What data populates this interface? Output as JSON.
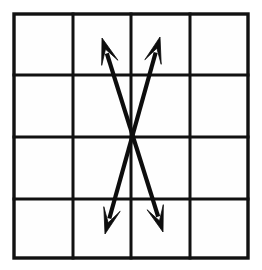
{
  "figure": {
    "canvas": {
      "width": 262,
      "height": 270,
      "background": "#ffffff"
    },
    "colors": {
      "ink": "#111111",
      "arrow": "#0d0d0d",
      "cell_fill": "#fefefe",
      "background": "#ffffff"
    }
  },
  "grid": {
    "name": "square-grid",
    "columns": 4,
    "rows": 4,
    "bounds": {
      "left": 14,
      "top": 14,
      "right": 248,
      "bottom": 258
    },
    "vertical_line_x": [
      14,
      73,
      131,
      190,
      248
    ],
    "horizontal_line_y": [
      14,
      75,
      137,
      199,
      258
    ],
    "line_width": 3,
    "border_width": 3.4
  },
  "arrows": [
    {
      "name": "arrow-up-left-down-right",
      "double_headed": true,
      "start": {
        "x": 102,
        "y": 38
      },
      "end": {
        "x": 163,
        "y": 232
      },
      "head_at_start": true,
      "head_at_end": true,
      "shaft_width": 4.2,
      "head_length": 26,
      "head_half_width": 8.5
    },
    {
      "name": "arrow-up-right-down-left",
      "double_headed": true,
      "start": {
        "x": 160,
        "y": 37
      },
      "end": {
        "x": 105,
        "y": 234
      },
      "head_at_start": true,
      "head_at_end": true,
      "shaft_width": 4.2,
      "head_length": 26,
      "head_half_width": 8.5
    }
  ],
  "intersection": {
    "name": "arrow-crossing-point",
    "x": 133,
    "y": 138,
    "note": "The two arrows cross on the middle horizontal grid line."
  }
}
